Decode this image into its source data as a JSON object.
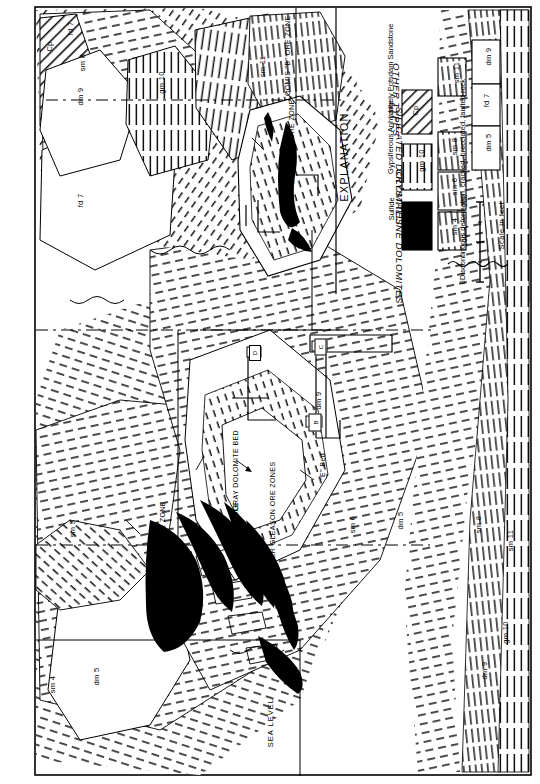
{
  "sheet": {
    "type": "geologic-cross-section",
    "orientation": "landscape-printed-sideways"
  },
  "explanation": {
    "title": "EXPLANATION",
    "groups": [
      {
        "name": "OTHER TYPES"
      },
      {
        "name": "SILICATED DOLOMITES"
      },
      {
        "name": "CRYSTALLINE DOLOMITES"
      }
    ],
    "units": [
      {
        "code": "Cp",
        "group": "OTHER TYPES",
        "pattern": "diagonal-hatch",
        "label": "Largely Potsdam Sandstone"
      },
      {
        "code": "gm 10",
        "group": "OTHER TYPES",
        "pattern": "vertical-dash",
        "label": "Gypsiferous Anhydrite"
      },
      {
        "code": "",
        "group": "OTHER TYPES",
        "pattern": "solid-black",
        "label": "Sulfide"
      },
      {
        "code": "sm 11",
        "group": "SILICATED DOLOMITES",
        "pattern": "vertical-dash",
        "label": ""
      },
      {
        "code": "sm 8",
        "group": "SILICATED DOLOMITES",
        "pattern": "vertical-dash",
        "label": ""
      },
      {
        "code": "sm 6",
        "group": "SILICATED DOLOMITES",
        "pattern": "vertical-dash",
        "label": ""
      },
      {
        "code": "sm 4",
        "group": "SILICATED DOLOMITES",
        "pattern": "vertical-dash",
        "label": ""
      },
      {
        "code": "dm 9",
        "group": "CRYSTALLINE DOLOMITES",
        "pattern": "blank",
        "label": ""
      },
      {
        "code": "fd 7",
        "group": "CRYSTALLINE DOLOMITES",
        "pattern": "blank",
        "label": ""
      },
      {
        "code": "dm 5",
        "group": "CRYSTALLINE DOLOMITES",
        "pattern": "blank",
        "label": ""
      }
    ],
    "deformation_symbol_caption": "Discontinuous deformation, cracked, brecciated, faulted rock",
    "scale": {
      "caption": "Scale in feet",
      "ticks": [
        "0",
        "100",
        "200"
      ]
    }
  },
  "map": {
    "ore_zones": [
      {
        "name": "LOOMIS \"B\" ORE ZONE"
      },
      {
        "name": "LOOMIS \"A\" ORE ZONE"
      },
      {
        "name": "UPPER GLEASON ORE ZONE"
      },
      {
        "name": "MIDDLE"
      },
      {
        "name": "LOWER GLEASON ORE ZONES"
      }
    ],
    "bed_labels": [
      {
        "name": "GRAY DOLOMITE BED"
      },
      {
        "name": "\"E\" Bed"
      }
    ],
    "datum": "SEA LEVEL",
    "unit_codes": [
      "fd 7",
      "Cp",
      "sm 8",
      "dm 9",
      "gm 10",
      "sm 11",
      "fd 7",
      "dm 5",
      "sm 4",
      "sm 6",
      "dm 5",
      "dm 9",
      "sm 11",
      "gm 10",
      "dm 9",
      "sm 8",
      "sm 5"
    ],
    "level_markers": [
      "B",
      "C",
      "D"
    ]
  }
}
